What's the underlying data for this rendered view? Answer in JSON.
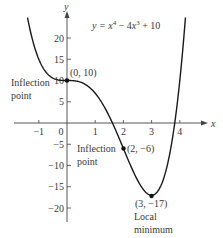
{
  "chart_data": {
    "type": "line",
    "equation": {
      "prefix": "y = ",
      "x": "x",
      "exp4": "4",
      "minus": " − 4",
      "x2": "x",
      "exp3": "3",
      "suffix": " + 10"
    },
    "xlabel": "x",
    "ylabel": "y",
    "xlim": [
      -1.4,
      4.2
    ],
    "ylim": [
      -25,
      26
    ],
    "x_ticks": [
      -1,
      0,
      1,
      2,
      3,
      4
    ],
    "x_tick_labels": [
      "−1",
      "0",
      "1",
      "2",
      "3",
      "4"
    ],
    "y_ticks": [
      20,
      15,
      10,
      5,
      -5,
      -10,
      -15,
      -20
    ],
    "y_tick_labels": [
      "20",
      "15",
      "10",
      "5",
      "−5",
      "−10",
      "−15",
      "−20"
    ],
    "grid": false,
    "series": [
      {
        "name": "y = x^4 − 4x^3 + 10",
        "function": "x^4 - 4x^3 + 10",
        "x_range": [
          -1.4,
          4.2
        ]
      }
    ],
    "points": [
      {
        "x": 0,
        "y": 10,
        "label": "(0, 10)",
        "annotation": [
          "Inflection",
          "point"
        ]
      },
      {
        "x": 2,
        "y": -6,
        "label": "(2, −6)",
        "annotation": [
          "Inflection",
          "point"
        ]
      },
      {
        "x": 3,
        "y": -17,
        "label": "(3, −17)",
        "annotation": [
          "Local",
          "minimum"
        ]
      }
    ]
  }
}
